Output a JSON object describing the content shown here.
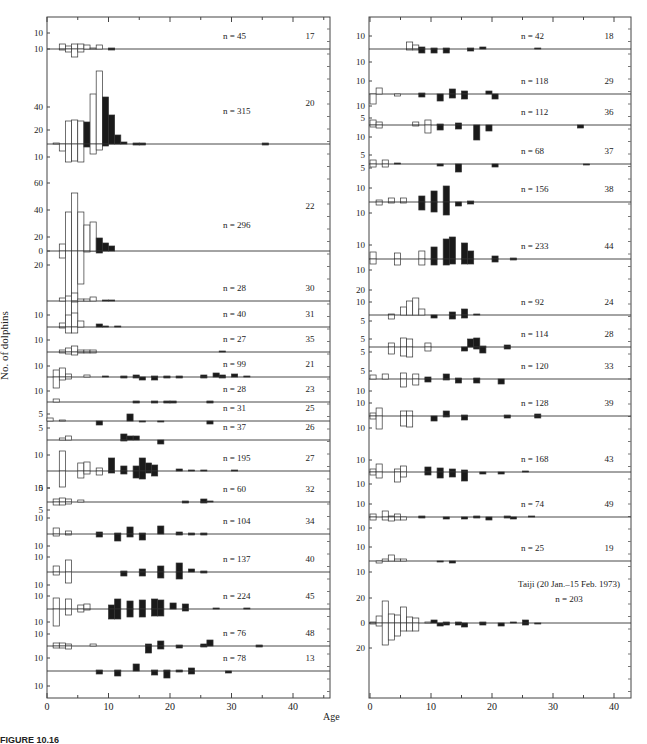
{
  "figure": {
    "y_axis_label": "No. of dolphins",
    "x_axis_label": "Age",
    "caption_visible": "FIGURE 10.16",
    "legend_note_left": "",
    "colors": {
      "female_fill": "#ffffff",
      "male_fill": "#1a1a1a",
      "stroke": "#333333"
    }
  },
  "chart_data": [
    {
      "type": "bar",
      "title": "Left panel: age composition by school",
      "xlabel": "Age",
      "ylabel": "No. of dolphins",
      "xlim": [
        0,
        46
      ],
      "x_ticks": [
        0,
        10,
        20,
        30,
        40
      ],
      "note": "Back-to-back histograms per school: above baseline / below baseline; open bars immature, filled bars mature",
      "schools": [
        {
          "id": "17",
          "n": "n = 45",
          "y_ticks": [
            "10",
            "10"
          ]
        },
        {
          "id": "20",
          "n": "n = 315",
          "y_ticks": [
            "40",
            "20",
            "10"
          ]
        },
        {
          "id": "22",
          "n": "n = 296",
          "y_ticks": [
            "60",
            "40",
            "20",
            "0",
            "20"
          ]
        },
        {
          "id": "30",
          "n": "n = 28",
          "y_ticks": []
        },
        {
          "id": "31",
          "n": "n = 40",
          "y_ticks": [
            "10"
          ]
        },
        {
          "id": "35",
          "n": "n = 27",
          "y_ticks": [
            "10"
          ]
        },
        {
          "id": "21",
          "n": "n = 99",
          "y_ticks": [
            "10"
          ]
        },
        {
          "id": "23",
          "n": "n = 28",
          "y_ticks": [
            "10"
          ]
        },
        {
          "id": "25",
          "n": "n = 31",
          "y_ticks": [
            "5"
          ]
        },
        {
          "id": "26",
          "n": "n = 37",
          "y_ticks": [
            "5"
          ]
        },
        {
          "id": "27",
          "n": "n = 195",
          "y_ticks": [
            "10",
            "10"
          ]
        },
        {
          "id": "32",
          "n": "n = 60",
          "y_ticks": [
            "5",
            "5"
          ]
        },
        {
          "id": "34",
          "n": "n = 104",
          "y_ticks": [
            "10",
            "10"
          ]
        },
        {
          "id": "40",
          "n": "n = 137",
          "y_ticks": [
            "10",
            "10"
          ]
        },
        {
          "id": "45",
          "n": "n = 224",
          "y_ticks": [
            "10",
            "10"
          ]
        },
        {
          "id": "48",
          "n": "n = 76",
          "y_ticks": [
            "10",
            "10"
          ]
        },
        {
          "id": "13",
          "n": "n = 78",
          "y_ticks": [
            "10"
          ]
        }
      ]
    },
    {
      "type": "bar",
      "title": "Right panel: age composition by school",
      "xlabel": "Age",
      "ylabel": "No. of dolphins",
      "xlim": [
        0,
        43
      ],
      "x_ticks": [
        0,
        10,
        20,
        30,
        40
      ],
      "schools": [
        {
          "id": "18",
          "n": "n = 42",
          "y_ticks": [
            "10",
            "10"
          ]
        },
        {
          "id": "29",
          "n": "n = 118",
          "y_ticks": [
            "10",
            "10"
          ]
        },
        {
          "id": "36",
          "n": "n = 112",
          "y_ticks": [
            "5",
            "10"
          ]
        },
        {
          "id": "37",
          "n": "n = 68",
          "y_ticks": [
            "5",
            "5"
          ]
        },
        {
          "id": "38",
          "n": "n = 156",
          "y_ticks": [
            "10",
            "10"
          ]
        },
        {
          "id": "44",
          "n": "n = 233",
          "y_ticks": [
            "10",
            "10"
          ]
        },
        {
          "id": "24",
          "n": "n = 92",
          "y_ticks": [
            "20",
            "10",
            "5"
          ]
        },
        {
          "id": "28",
          "n": "n = 114",
          "y_ticks": [
            "5",
            "5"
          ]
        },
        {
          "id": "33",
          "n": "n = 120",
          "y_ticks": [
            "5",
            "10"
          ]
        },
        {
          "id": "39",
          "n": "n = 128",
          "y_ticks": [
            "10",
            "10"
          ]
        },
        {
          "id": "43",
          "n": "n = 168",
          "y_ticks": [
            "10",
            "10"
          ]
        },
        {
          "id": "49",
          "n": "n = 74",
          "y_ticks": [
            "10",
            "10"
          ]
        },
        {
          "id": "19",
          "n": "n = 25",
          "y_ticks": [
            "10",
            "10"
          ]
        },
        {
          "id": "Taiji",
          "label": "Taiji (20 Jan.–15 Feb. 1973)",
          "n": "n = 203",
          "y_ticks": [
            "20",
            "0",
            "20"
          ]
        }
      ]
    }
  ]
}
